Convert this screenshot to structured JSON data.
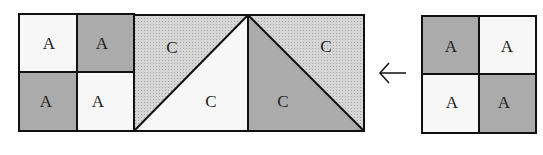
{
  "diagram": {
    "colors": {
      "light": "#f7f7f7",
      "medium_dotted": "#d2d2d2",
      "dark": "#ababab",
      "outline": "#111111"
    },
    "left_four_patch": {
      "cells": [
        {
          "label": "A",
          "shade": "light"
        },
        {
          "label": "A",
          "shade": "dark"
        },
        {
          "label": "A",
          "shade": "dark"
        },
        {
          "label": "A",
          "shade": "light"
        }
      ]
    },
    "triangle_units": [
      {
        "upper_label": "C",
        "upper_shade": "medium_dotted",
        "lower_label": "C",
        "lower_shade": "light"
      },
      {
        "upper_label": "C",
        "upper_shade": "medium_dotted",
        "lower_label": "C",
        "lower_shade": "dark"
      }
    ],
    "arrow": {
      "glyph": "←",
      "direction": "left"
    },
    "right_four_patch": {
      "cells": [
        {
          "label": "A",
          "shade": "dark"
        },
        {
          "label": "A",
          "shade": "light"
        },
        {
          "label": "A",
          "shade": "light"
        },
        {
          "label": "A",
          "shade": "dark"
        }
      ]
    }
  }
}
